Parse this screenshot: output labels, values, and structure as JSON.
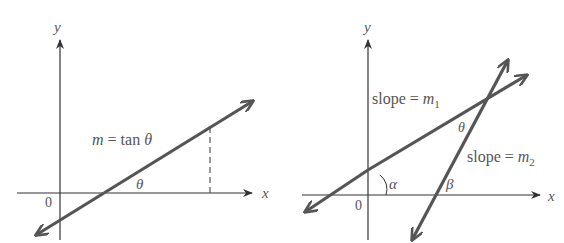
{
  "colors": {
    "axis": "#333333",
    "line": "#555555",
    "text": "#555555",
    "background": "#ffffff"
  },
  "left_panel": {
    "y_axis_label": "y",
    "x_axis_label": "x",
    "origin_label": "0",
    "line_label": {
      "var": "m",
      "eq": " = tan ",
      "angle": "θ"
    },
    "angle_label": "θ"
  },
  "right_panel": {
    "y_axis_label": "y",
    "x_axis_label": "x",
    "origin_label": "0",
    "line1_label": {
      "text": "slope = ",
      "var": "m",
      "sub": "1"
    },
    "line2_label": {
      "text": "slope = ",
      "var": "m",
      "sub": "2"
    },
    "angle_between_label": "θ",
    "angle_alpha_label": "α",
    "angle_beta_label": "β"
  }
}
